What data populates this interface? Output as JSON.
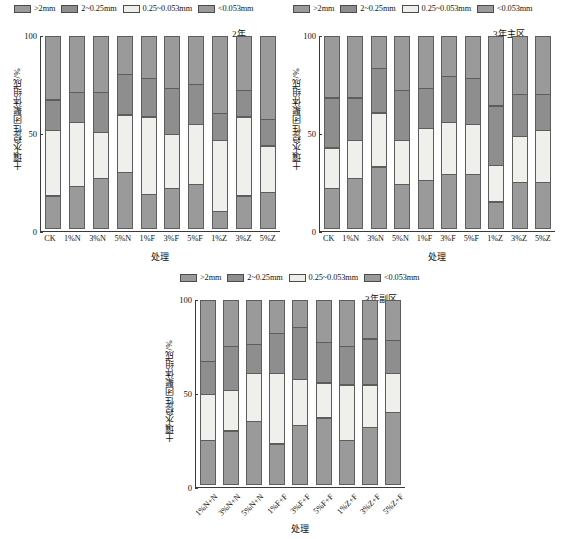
{
  "figure": {
    "legend_labels": [
      ">2mm",
      "2~0.25mm",
      "0.25~0.053mm",
      "<0.053mm"
    ],
    "legend_colors": [
      "#9a9a9a",
      "#8e8e8e",
      "#eeeeea",
      "#9a9a9a"
    ],
    "y_axis_title": "土壤水稳性团聚体组成/%",
    "x_axis_title": "处理",
    "y_ticks": [
      "0",
      "50",
      "100"
    ],
    "series_names": [
      ">2mm",
      "2~0.25mm",
      "0.25~0.053mm",
      "<0.053mm"
    ],
    "colors": {
      "gt2mm": "#9a9a9a",
      "s2_025": "#8e8e8e",
      "s025_0053": "#efefeb",
      "lt0053": "#9a9a9a",
      "edge": "#5d5d5d",
      "axis": "#3a3a3a",
      "text": "#111111",
      "background": "#ffffff"
    }
  },
  "chart_data": [
    {
      "type": "bar",
      "id": "panel-year2",
      "title": "2年",
      "xlabel": "处理",
      "ylabel": "土壤水稳性团聚体组成/%",
      "ylim": [
        0,
        100
      ],
      "yticks": [
        0,
        50,
        100
      ],
      "grid": false,
      "stacked": true,
      "legend_position": "top",
      "categories": [
        "CK",
        "1%N",
        "3%N",
        "5%N",
        "1%F",
        "3%F",
        "5%F",
        "1%Z",
        "3%Z",
        "5%Z"
      ],
      "series": [
        {
          "name": "<0.053mm",
          "values": [
            17,
            22,
            26,
            29,
            18,
            21,
            23,
            9,
            17,
            19
          ]
        },
        {
          "name": "0.25~0.053mm",
          "values": [
            34,
            33,
            24,
            30,
            40,
            28,
            31,
            37,
            41,
            24
          ]
        },
        {
          "name": "2~0.25mm",
          "values": [
            16,
            16,
            21,
            21,
            20,
            24,
            21,
            14,
            14,
            14
          ]
        },
        {
          "name": ">2mm",
          "values": [
            33,
            29,
            29,
            20,
            22,
            27,
            25,
            40,
            28,
            43
          ]
        }
      ]
    },
    {
      "type": "bar",
      "id": "panel-year3-main",
      "title": "3年主区",
      "xlabel": "处理",
      "ylabel": "土壤水稳性团聚体组成/%",
      "ylim": [
        0,
        100
      ],
      "yticks": [
        0,
        50,
        100
      ],
      "grid": false,
      "stacked": true,
      "legend_position": "top",
      "categories": [
        "CK",
        "1%N",
        "3%N",
        "5%N",
        "1%F",
        "3%F",
        "5%F",
        "1%Z",
        "3%Z",
        "5%Z"
      ],
      "series": [
        {
          "name": "<0.053mm",
          "values": [
            21,
            26,
            32,
            23,
            25,
            28,
            28,
            14,
            24,
            24
          ]
        },
        {
          "name": "0.25~0.053mm",
          "values": [
            21,
            20,
            28,
            23,
            27,
            27,
            26,
            19,
            24,
            27
          ]
        },
        {
          "name": "2~0.25mm",
          "values": [
            26,
            22,
            23,
            26,
            21,
            24,
            24,
            31,
            22,
            19
          ]
        },
        {
          "name": ">2mm",
          "values": [
            32,
            32,
            17,
            28,
            27,
            21,
            22,
            36,
            30,
            30
          ]
        }
      ]
    },
    {
      "type": "bar",
      "id": "panel-year3-sub",
      "title": "3年副区",
      "xlabel": "处理",
      "ylabel": "土壤水稳性团聚体组成/%",
      "ylim": [
        0,
        100
      ],
      "yticks": [
        0,
        50,
        100
      ],
      "grid": false,
      "stacked": true,
      "legend_position": "top",
      "categories": [
        "1%N+N",
        "3%N+N",
        "5%N+N",
        "1%F+F",
        "3%F+F",
        "5%F+F",
        "1%Z+F",
        "3%Z+F",
        "5%Z+F"
      ],
      "series": [
        {
          "name": "<0.053mm",
          "values": [
            24,
            29,
            34,
            22,
            32,
            36,
            24,
            31,
            39
          ]
        },
        {
          "name": "0.25~0.053mm",
          "values": [
            25,
            22,
            26,
            38,
            25,
            19,
            30,
            23,
            21
          ]
        },
        {
          "name": "2~0.25mm",
          "values": [
            18,
            24,
            16,
            22,
            28,
            22,
            21,
            25,
            18
          ]
        },
        {
          "name": ">2mm",
          "values": [
            33,
            25,
            24,
            18,
            15,
            23,
            25,
            21,
            22
          ]
        }
      ]
    }
  ]
}
